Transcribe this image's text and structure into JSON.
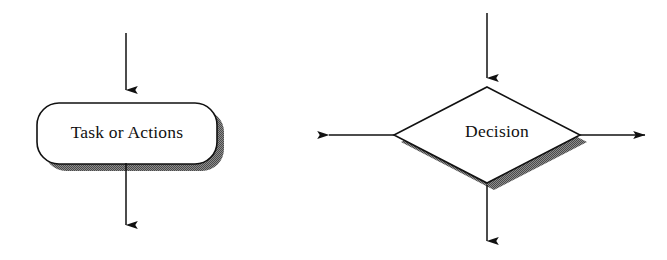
{
  "diagram": {
    "background_color": "#ffffff",
    "stroke_color": "#111111",
    "shadow_color": "#787878",
    "fill_color": "#ffffff",
    "nodes": [
      {
        "id": "task",
        "kind": "rounded-rectangle",
        "label": "Task or Actions",
        "center_x": 127,
        "center_y": 134,
        "width": 180,
        "height": 61,
        "corner_radius": 22,
        "shadow_offset_x": 7,
        "shadow_offset_y": 7
      },
      {
        "id": "decision",
        "kind": "diamond",
        "label": "Decision",
        "center_x": 487,
        "center_y": 135,
        "half_width": 93,
        "half_height": 48,
        "label_offset_x": 10,
        "label_offset_y": -2,
        "shadow_offset_x": 7,
        "shadow_offset_y": 7
      }
    ],
    "arrows": [
      {
        "id": "task-in",
        "direction": "down",
        "x1": 126,
        "y1": 33,
        "x2": 126,
        "y2": 90
      },
      {
        "id": "task-out",
        "direction": "down",
        "x1": 126,
        "y1": 163,
        "x2": 126,
        "y2": 225
      },
      {
        "id": "decision-in",
        "direction": "down",
        "x1": 487,
        "y1": 13,
        "x2": 487,
        "y2": 78
      },
      {
        "id": "decision-out-down",
        "direction": "down",
        "x1": 487,
        "y1": 185,
        "x2": 487,
        "y2": 241
      },
      {
        "id": "decision-out-left",
        "direction": "left",
        "x1": 394,
        "y1": 135,
        "x2": 329,
        "y2": 135
      },
      {
        "id": "decision-out-right",
        "direction": "right",
        "x1": 580,
        "y1": 135,
        "x2": 645,
        "y2": 135
      }
    ]
  }
}
